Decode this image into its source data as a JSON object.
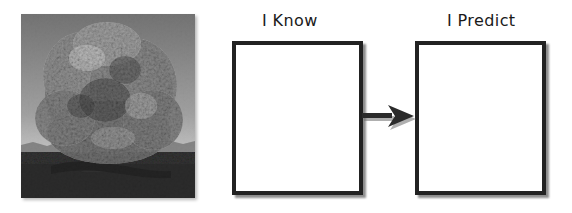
{
  "page": {
    "background_color": "#ffffff"
  },
  "photo": {
    "alt": "Black and white photograph of a large broad leafy tree",
    "subject": "tree",
    "style": "grayscale photograph",
    "sky_color_top": "#6f6f6f",
    "sky_color_bottom": "#d2d2d2",
    "foliage_color": "#9a9a9a",
    "ground_color": "#232323"
  },
  "organizer": {
    "columns": [
      {
        "id": "know",
        "label": "I Know",
        "box_value": "",
        "box_placeholder": ""
      },
      {
        "id": "predict",
        "label": "I Predict",
        "box_value": "",
        "box_placeholder": ""
      }
    ],
    "connector": {
      "icon": "arrow-right-icon",
      "direction": "right",
      "color": "#2b2b2b"
    },
    "border_color": "#222222",
    "box_fill_color": "#ffffff",
    "text_color": "#1a1a1a"
  }
}
